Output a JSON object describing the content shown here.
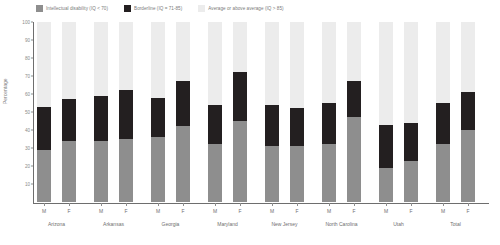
{
  "chart_data": {
    "type": "bar",
    "subtype": "stacked-bar-100",
    "title": "",
    "xlabel": "",
    "ylabel": "Percentage",
    "ylim": [
      0,
      100
    ],
    "yticks": [
      0,
      10,
      20,
      30,
      40,
      50,
      60,
      70,
      80,
      90,
      100
    ],
    "ytick_labels": [
      "0",
      "10",
      "20",
      "30",
      "40",
      "50",
      "60",
      "70",
      "80",
      "90",
      "100"
    ],
    "grid": false,
    "legend_position": "top-left",
    "legend": [
      {
        "label": "Intellectual disability (IQ < 70)",
        "color": "#8e8e8e",
        "key": "intellectual_disability"
      },
      {
        "label": "Borderline (IQ = 71-85)",
        "color": "#231f20",
        "key": "borderline"
      },
      {
        "label": "Average or above average (IQ > 85)",
        "color": "#ececec",
        "key": "average_or_above"
      }
    ],
    "groups": [
      "Arizona",
      "Arkansas",
      "Georgia",
      "Maryland",
      "New Jersey",
      "North Carolina",
      "Utah",
      "Total"
    ],
    "subcategories": [
      "M",
      "F"
    ],
    "categories": [
      "Arizona M",
      "Arizona F",
      "Arkansas M",
      "Arkansas F",
      "Georgia M",
      "Georgia F",
      "Maryland M",
      "Maryland F",
      "New Jersey M",
      "New Jersey F",
      "North Carolina M",
      "North Carolina F",
      "Utah M",
      "Utah F",
      "Total M",
      "Total F"
    ],
    "series": [
      {
        "name": "Intellectual disability (IQ < 70)",
        "color": "#8e8e8e",
        "values": [
          29,
          34,
          34,
          35,
          36,
          42,
          32,
          45,
          31,
          31,
          32,
          47,
          19,
          23,
          32,
          40
        ]
      },
      {
        "name": "Borderline (IQ = 71-85)",
        "color": "#231f20",
        "values": [
          24,
          23,
          25,
          27,
          22,
          25,
          22,
          27,
          23,
          21,
          23,
          20,
          24,
          21,
          23,
          21
        ]
      },
      {
        "name": "Average or above average (IQ > 85)",
        "color": "#ececec",
        "values": [
          47,
          43,
          41,
          38,
          42,
          33,
          46,
          28,
          46,
          48,
          45,
          33,
          57,
          56,
          45,
          39
        ]
      }
    ],
    "cumulative_tops": {
      "intellectual_disability": [
        29,
        34,
        34,
        35,
        36,
        42,
        32,
        45,
        31,
        31,
        32,
        47,
        19,
        23,
        32,
        40
      ],
      "borderline": [
        53,
        57,
        59,
        62,
        58,
        67,
        54,
        72,
        54,
        52,
        55,
        67,
        43,
        44,
        55,
        61
      ],
      "average_or_above": [
        100,
        100,
        100,
        100,
        100,
        100,
        100,
        100,
        100,
        100,
        100,
        100,
        100,
        100,
        100,
        100
      ]
    }
  }
}
